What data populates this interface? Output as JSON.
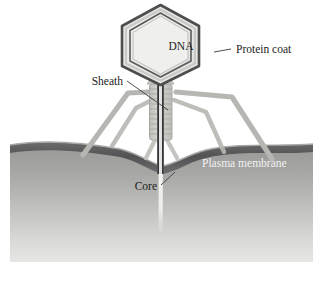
{
  "figure": {
    "background_color": "#ffffff",
    "width": 323,
    "height": 285
  },
  "labels": {
    "dna": "DNA",
    "protein_coat": "Protein coat",
    "sheath": "Sheath",
    "core": "Core",
    "plasma_membrane": "Plasma membrane"
  },
  "colors": {
    "text": "#1c1c1c",
    "text_on_membrane": "#f2f2f2",
    "capsid_outline": "#4a4a4a",
    "capsid_inner_line": "#58585a",
    "capsid_fill": "#ececea",
    "capsid_band": "#cfcfcd",
    "tail_sheath": "#c9c9c6",
    "tail_sheath_edge": "#a8a8a4",
    "tail_core": "#3a3a3c",
    "fiber": "#b4b4b0",
    "membrane_dark": "#5d5d5e",
    "membrane_light": "#9e9e9c",
    "cytoplasm_top": "#9b9b99",
    "cytoplasm_bottom": "#e2e2e0",
    "extracellular": "#ffffff",
    "injected_dna": "#f4f4f2",
    "leader_line": "#3a3a3a"
  },
  "parts": [
    {
      "name": "capsid-head",
      "label_key": "dna",
      "shape": "hexagon"
    },
    {
      "name": "protein-coat-layer",
      "label_key": "protein_coat",
      "shape": "hexagon-outline"
    },
    {
      "name": "tail-sheath",
      "label_key": "sheath",
      "shape": "striated-tube"
    },
    {
      "name": "tail-core",
      "label_key": "core",
      "shape": "vertical-rod"
    },
    {
      "name": "plasma-membrane",
      "label_key": "plasma_membrane",
      "shape": "wavy-band"
    },
    {
      "name": "tail-fiber-left",
      "label_key": null,
      "shape": "bent-leg"
    },
    {
      "name": "tail-fiber-right",
      "label_key": null,
      "shape": "bent-leg"
    },
    {
      "name": "injected-dna-strand",
      "label_key": null,
      "shape": "vertical-strand"
    }
  ]
}
